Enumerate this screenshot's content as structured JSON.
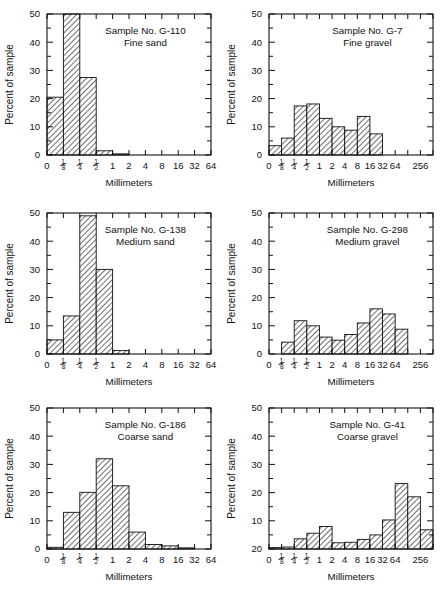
{
  "figure": {
    "axis_x_title": "Millimeters",
    "axis_y_title": "Percent of sample"
  },
  "chart_data": [
    {
      "type": "bar",
      "panel": "top-left",
      "title": "Sample No. G-110",
      "subtitle": "Fine sand",
      "xlabel": "Millimeters",
      "ylabel": "Percent of sample",
      "ylim": [
        0,
        50
      ],
      "yticks": [
        0,
        10,
        20,
        30,
        40,
        50
      ],
      "xtick_labels": [
        "0",
        "1/8",
        "1/4",
        "1/2",
        "1",
        "2",
        "4",
        "8",
        "16",
        "32",
        "64"
      ],
      "categories": [
        "0-1/8",
        "1/8-1/4",
        "1/4-1/2",
        "1/2-1",
        "1-2"
      ],
      "values": [
        20.5,
        50,
        27.5,
        1.5,
        0.4
      ],
      "grid": false,
      "legend": null
    },
    {
      "type": "bar",
      "panel": "top-right",
      "title": "Sample No. G-7",
      "subtitle": "Fine gravel",
      "xlabel": "Millimeters",
      "ylabel": "Percent of sample",
      "ylim": [
        0,
        50
      ],
      "yticks": [
        0,
        10,
        20,
        30,
        40,
        50
      ],
      "xtick_labels": [
        "0",
        "1/8",
        "1/4",
        "1/2",
        "1",
        "2",
        "4",
        "8",
        "16",
        "32",
        "64",
        "",
        "256",
        ""
      ],
      "categories": [
        "0-1/8",
        "1/8-1/4",
        "1/4-1/2",
        "1/2-1",
        "1-2",
        "2-4",
        "4-8",
        "8-16",
        "16-32"
      ],
      "values": [
        3.3,
        6.0,
        17.4,
        18.1,
        13.0,
        10.0,
        8.8,
        13.7,
        7.5
      ],
      "grid": false,
      "legend": null
    },
    {
      "type": "bar",
      "panel": "middle-left",
      "title": "Sample No. G-138",
      "subtitle": "Medium sand",
      "xlabel": "Millimeters",
      "ylabel": "Percent of sample",
      "ylim": [
        0,
        50
      ],
      "yticks": [
        0,
        10,
        20,
        30,
        40,
        50
      ],
      "xtick_labels": [
        "0",
        "1/8",
        "1/4",
        "1/2",
        "1",
        "2",
        "4",
        "8",
        "16",
        "32",
        "64"
      ],
      "categories": [
        "0-1/8",
        "1/8-1/4",
        "1/4-1/2",
        "1/2-1",
        "1-2"
      ],
      "values": [
        5.0,
        13.5,
        49.0,
        30.0,
        1.2
      ],
      "grid": false,
      "legend": null
    },
    {
      "type": "bar",
      "panel": "middle-right",
      "title": "Sample No. G-298",
      "subtitle": "Medium gravel",
      "xlabel": "Millimeters",
      "ylabel": "Percent of sample",
      "ylim": [
        0,
        50
      ],
      "yticks": [
        0,
        10,
        20,
        30,
        40,
        50
      ],
      "xtick_labels": [
        "0",
        "1/8",
        "1/4",
        "1/2",
        "1",
        "2",
        "4",
        "8",
        "16",
        "32",
        "64",
        "",
        "256",
        ""
      ],
      "categories": [
        "1/8-1/4",
        "1/4-1/2",
        "1/2-1",
        "1-2",
        "2-4",
        "4-8",
        "8-16",
        "16-32",
        "32-64",
        "64-128"
      ],
      "values": [
        4.2,
        11.8,
        10.0,
        6.0,
        4.9,
        6.9,
        11.0,
        16.0,
        14.2,
        8.8
      ],
      "grid": false,
      "legend": null
    },
    {
      "type": "bar",
      "panel": "bottom-left",
      "title": "Sample No. G-186",
      "subtitle": "Coarse sand",
      "xlabel": "Millimeters",
      "ylabel": "Percent of sample",
      "ylim": [
        0,
        50
      ],
      "yticks": [
        0,
        10,
        20,
        30,
        40,
        50
      ],
      "xtick_labels": [
        "0",
        "1/8",
        "1/4",
        "1/2",
        "1",
        "2",
        "4",
        "8",
        "16",
        "32",
        "64"
      ],
      "categories": [
        "0-1/8",
        "1/8-1/4",
        "1/4-1/2",
        "1/2-1",
        "1-2",
        "2-4",
        "4-8",
        "8-16",
        "16-32"
      ],
      "values": [
        0.6,
        13.0,
        20.1,
        32.0,
        22.4,
        6.0,
        1.6,
        1.1,
        0.4
      ],
      "grid": false,
      "legend": null
    },
    {
      "type": "bar",
      "panel": "bottom-right",
      "title": "Sample No. G-41",
      "subtitle": "Coarse gravel",
      "xlabel": "Millimeters",
      "ylabel": "Percent of sample",
      "ylim": [
        0,
        50
      ],
      "yticks": [
        20,
        10,
        20,
        30,
        40,
        50
      ],
      "ytick_labels": [
        "20",
        "10",
        "20",
        "30",
        "40",
        "50"
      ],
      "xtick_labels": [
        "0",
        "1/8",
        "1/4",
        "1/2",
        "1",
        "2",
        "4",
        "8",
        "16",
        "32",
        "64",
        "",
        "256",
        ""
      ],
      "categories": [
        "0-1/8",
        "1/8-1/4",
        "1/4-1/2",
        "1/2-1",
        "1-2",
        "2-4",
        "4-8",
        "8-16",
        "16-32",
        "32-64",
        "64-128",
        "128-256",
        "256-512"
      ],
      "values": [
        0.5,
        0.7,
        3.6,
        5.6,
        8.0,
        2.2,
        2.4,
        3.4,
        5.0,
        10.3,
        23.2,
        18.5,
        6.8
      ],
      "grid": false,
      "legend": null
    }
  ]
}
